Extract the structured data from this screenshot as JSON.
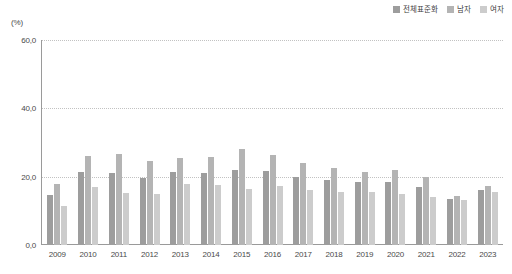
{
  "unit_label": "(%)",
  "legend": {
    "position": "top-right",
    "items": [
      {
        "label": "전체표준화",
        "color": "#9d9d9d",
        "swatch": "legend-swatch-total"
      },
      {
        "label": "남자",
        "color": "#b4b4b4",
        "swatch": "legend-swatch-male"
      },
      {
        "label": "여자",
        "color": "#cccccc",
        "swatch": "legend-swatch-female"
      }
    ]
  },
  "yticks": [
    "0,0",
    "20,0",
    "40,0",
    "60,0"
  ],
  "chart_data": {
    "type": "bar",
    "title": "",
    "subtitle": "",
    "xlabel": "",
    "ylabel": "(%)",
    "ylim": [
      0,
      60
    ],
    "ytick_values": [
      0,
      20,
      40,
      60
    ],
    "grid": true,
    "legend_position": "top-right",
    "categories": [
      "2009",
      "2010",
      "2011",
      "2012",
      "2013",
      "2014",
      "2015",
      "2016",
      "2017",
      "2018",
      "2019",
      "2020",
      "2021",
      "2022",
      "2023"
    ],
    "series": [
      {
        "name": "전체표준화",
        "color": "#9d9d9d",
        "values": [
          14.7,
          21.5,
          21.0,
          19.5,
          21.5,
          21.2,
          22.0,
          21.8,
          20.0,
          19.0,
          18.5,
          18.4,
          17.0,
          13.6,
          16.2
        ]
      },
      {
        "name": "남자",
        "color": "#b4b4b4",
        "values": [
          18.0,
          26.0,
          26.5,
          24.5,
          25.5,
          25.8,
          28.0,
          26.3,
          24.0,
          22.5,
          21.5,
          22.0,
          20.0,
          14.2,
          17.2
        ]
      },
      {
        "name": "여자",
        "color": "#cccccc",
        "values": [
          11.5,
          17.0,
          15.2,
          15.0,
          18.0,
          17.5,
          16.3,
          17.2,
          16.0,
          15.5,
          15.5,
          15.0,
          14.0,
          13.2,
          15.5
        ]
      }
    ]
  }
}
